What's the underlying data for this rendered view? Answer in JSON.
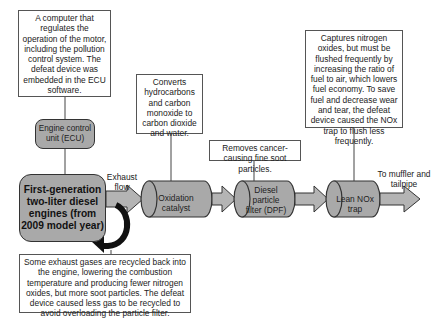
{
  "diagram": {
    "notes": {
      "ecu_note": "A computer that regulates the operation of the motor, including the pollution control system. The defeat device was embedded in the ECU software.",
      "oxidation_note": "Converts hydrocarbons and carbon monoxide to carbon dioxide and water.",
      "dpf_note": "Removes cancer-causing fine soot particles.",
      "nox_note": "Captures nitrogen oxides, but must be flushed frequently by increasing the ratio of fuel to air, which lowers fuel economy. To save fuel and decrease wear and tear, the defeat device caused the NOx trap to flush less frequently.",
      "egr_note": "Some exhaust gases are recycled back into the engine, lowering the combustion temperature and producing fewer nitrogen oxides, but more soot particles. The defeat device caused less gas to be recycled to avoid overloading the particle filter."
    },
    "components": {
      "ecu": "Engine control unit (ECU)",
      "engine": "First-generation two-liter diesel engines (from 2009 model year)",
      "oxidation_catalyst": "Oxidation catalyst",
      "dpf": "Diesel particle filter (DPF)",
      "nox_trap": "Lean NOx trap"
    },
    "flow_labels": {
      "exhaust": "Exhaust flow",
      "outlet": "To muffler and tailpipe"
    },
    "icons": {
      "recirculation": "curved-recirculation-arrow-icon",
      "flow": "right-arrow-icon"
    },
    "colors": {
      "component_fill": "#a9a9a9",
      "arrow_fill": "#b4b4b4",
      "outline": "#333333",
      "recirc_arrow": "#111111"
    }
  }
}
